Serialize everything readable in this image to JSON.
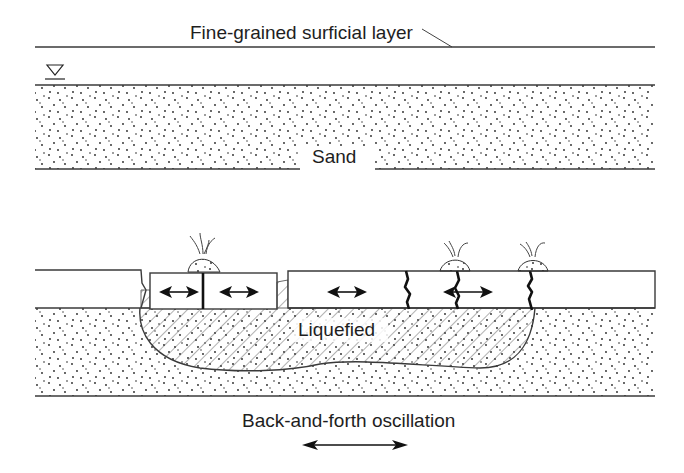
{
  "diagram": {
    "upper_panel": {
      "layer_label": "Fine-grained surficial layer",
      "water_table_symbol": "water-table-triangle",
      "sand_label": "Sand"
    },
    "lower_panel": {
      "liquefied_label": "Liquefied",
      "sand_boils": 3,
      "cracks": 4,
      "oscillation_arrows": 4
    },
    "caption": "Back-and-forth oscillation",
    "colors": {
      "ink": "#1e1e1e",
      "background": "#ffffff"
    }
  }
}
